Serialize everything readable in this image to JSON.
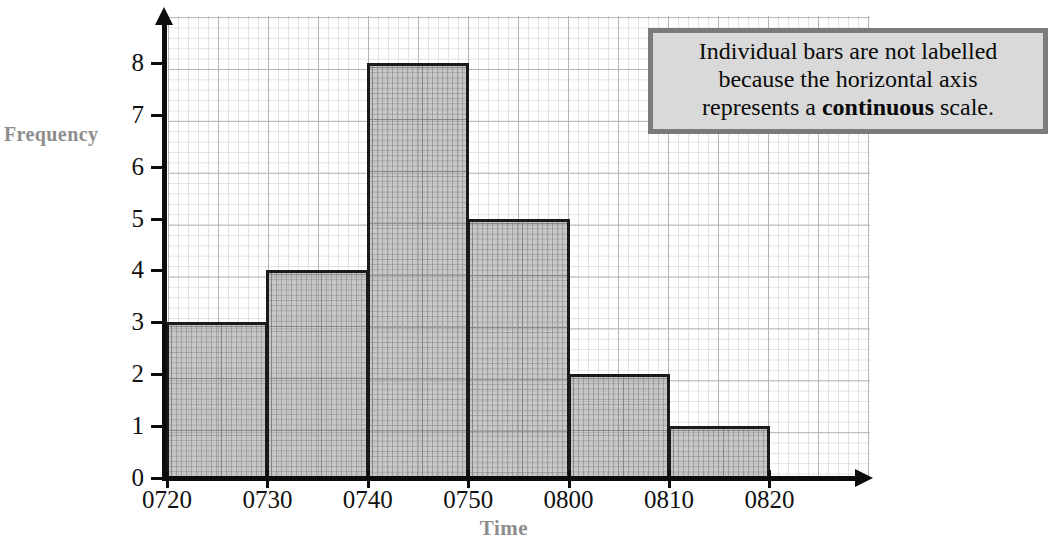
{
  "chart_data": {
    "type": "bar",
    "title": "",
    "xlabel": "Time",
    "ylabel": "Frequency",
    "categories": [
      "0720-0730",
      "0730-0740",
      "0740-0750",
      "0750-0800",
      "0800-0810",
      "0810-0820"
    ],
    "values": [
      3,
      4,
      8,
      5,
      2,
      1
    ],
    "bin_edges": [
      "0720",
      "0730",
      "0740",
      "0750",
      "0800",
      "0810",
      "0820"
    ],
    "xticklabels": [
      "0720",
      "0730",
      "0740",
      "0750",
      "0800",
      "0810",
      "0820"
    ],
    "yticklabels": [
      "0",
      "1",
      "2",
      "3",
      "4",
      "5",
      "6",
      "7",
      "8"
    ],
    "ylim": [
      0,
      8.7
    ],
    "grid": true,
    "legend": false,
    "annotations": [
      "Individual bars are not labelled because the horizontal axis represents a continuous scale."
    ]
  },
  "axes": {
    "y_title": "Frequency",
    "x_title": "Time",
    "y_ticks": [
      "0",
      "1",
      "2",
      "3",
      "4",
      "5",
      "6",
      "7",
      "8"
    ],
    "x_ticks": [
      "0720",
      "0730",
      "0740",
      "0750",
      "0800",
      "0810",
      "0820"
    ]
  },
  "callout": {
    "line1": "Individual bars are not labelled",
    "line2": "because the horizontal axis",
    "line3_pre": "represents a ",
    "line3_bold": "continuous",
    "line3_post": " scale."
  },
  "colors": {
    "bar_fill": "#a8a8a8",
    "bar_outline": "#1a1a1a",
    "axis": "#0d0d0d",
    "grid_major": "#b5b5b5",
    "grid_minor": "#e2e2e2",
    "axis_title": "#8d8d8d",
    "callout_bg": "#d9d9d9",
    "callout_border": "#7b7b7b"
  }
}
